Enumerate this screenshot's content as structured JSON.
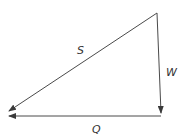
{
  "diagram": {
    "type": "vector-triangle",
    "colors": {
      "line": "#4a4a4a",
      "label": "#333333",
      "background": "#ffffff"
    },
    "vectors": [
      {
        "id": "S",
        "label": "S",
        "from": [
          157,
          13
        ],
        "to": [
          9,
          111
        ],
        "label_pos": [
          77,
          54
        ]
      },
      {
        "id": "W",
        "label": "W",
        "from": [
          157,
          13
        ],
        "to": [
          161,
          113
        ],
        "label_pos": [
          166,
          76
        ]
      },
      {
        "id": "Q",
        "label": "Q",
        "from": [
          161,
          116
        ],
        "to": [
          9,
          116
        ],
        "label_pos": [
          92,
          133
        ]
      }
    ]
  }
}
